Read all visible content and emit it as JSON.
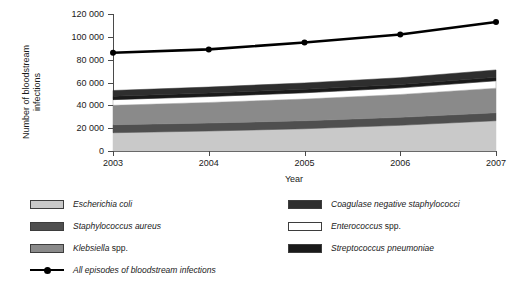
{
  "chart_data": {
    "type": "area",
    "title": "",
    "xlabel": "Year",
    "ylabel": "Number of bloodstream infections",
    "x": [
      2003,
      2004,
      2005,
      2006,
      2007
    ],
    "xtick_labels": [
      "2003",
      "2004",
      "2005",
      "2006",
      "2007"
    ],
    "ytick_labels": [
      "0",
      "20 000",
      "40 000",
      "60 000",
      "80 000",
      "100 000",
      "120 000"
    ],
    "ytick_values": [
      0,
      20000,
      40000,
      60000,
      80000,
      100000,
      120000
    ],
    "ylim": [
      0,
      120000
    ],
    "xlim": [
      2003,
      2007
    ],
    "grid": false,
    "legend_position": "below",
    "stacked": true,
    "series": [
      {
        "name": "Escherichia coli",
        "italic": true,
        "color": "#c9c9c9",
        "values": [
          16000,
          17500,
          19500,
          22500,
          26500
        ],
        "order": 1
      },
      {
        "name": "Staphylococcus aureus",
        "italic": true,
        "color": "#4f4f4f",
        "values": [
          7000,
          7000,
          7000,
          7000,
          7000
        ],
        "order": 2
      },
      {
        "name": "Klebsiella spp.",
        "italic_prefix": "Klebsiella",
        "plain_suffix": " spp.",
        "color": "#8a8a8a",
        "values": [
          17000,
          18000,
          19000,
          20000,
          21500
        ],
        "order": 3
      },
      {
        "name": "Enterococcus spp.",
        "italic_prefix": "Enterococcus",
        "plain_suffix": " spp.",
        "color": "#ffffff",
        "values": [
          5000,
          5200,
          5500,
          5800,
          6500
        ],
        "order": 4
      },
      {
        "name": "Streptococcus pneumoniae",
        "italic": true,
        "color": "#1a1a1a",
        "values": [
          3000,
          3000,
          3000,
          3000,
          3000
        ],
        "order": 5
      },
      {
        "name": "Coagulase negative staphylococci",
        "italic": true,
        "color": "#2e2e2e",
        "values": [
          5000,
          5300,
          5600,
          5900,
          6500
        ],
        "order": 6
      }
    ],
    "line_series": {
      "name": "All episodes of bloodstream infections",
      "italic": true,
      "color": "#000000",
      "marker": "circle",
      "values": [
        86000,
        89000,
        95000,
        102000,
        113000
      ]
    }
  },
  "legend": {
    "left_column": [
      {
        "label": "Escherichia coli",
        "style": "italic",
        "swatch": "#c9c9c9"
      },
      {
        "label": "Staphylococcus aureus",
        "style": "italic",
        "swatch": "#4f4f4f"
      },
      {
        "label": "Klebsiella spp.",
        "style": "italic-partial",
        "swatch": "#8a8a8a"
      }
    ],
    "right_column": [
      {
        "label": "Coagulase negative staphylococci",
        "style": "italic",
        "swatch": "#2e2e2e"
      },
      {
        "label": "Enterococcus spp.",
        "style": "italic-partial",
        "swatch": "#ffffff"
      },
      {
        "label": "Streptococcus pneumoniae",
        "style": "italic",
        "swatch": "#1a1a1a"
      }
    ],
    "line_entry": {
      "label": "All episodes of bloodstream infections",
      "style": "italic",
      "color": "#000000"
    }
  }
}
